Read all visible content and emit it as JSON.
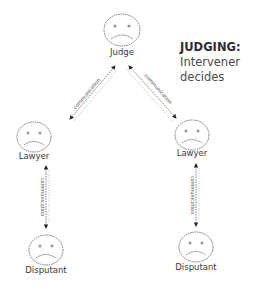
{
  "caption": {
    "title": "JUDGING:",
    "line1": "Intervener",
    "line2": "decides"
  },
  "nodes": {
    "judge": {
      "label": "Judge",
      "expression": "sad"
    },
    "lawyer_left": {
      "label": "Lawyer",
      "expression": "sad"
    },
    "lawyer_right": {
      "label": "Lawyer",
      "expression": "sad"
    },
    "disputant_left": {
      "label": "Disputant",
      "expression": "sad"
    },
    "disputant_right": {
      "label": "Disputant",
      "expression": "sad"
    }
  },
  "edges": [
    {
      "from": "lawyer_left",
      "to": "judge",
      "label": "communication",
      "direction": "bidirectional"
    },
    {
      "from": "judge",
      "to": "lawyer_right",
      "label": "communication",
      "direction": "bidirectional"
    },
    {
      "from": "lawyer_left",
      "to": "disputant_left",
      "label": "communication",
      "direction": "bidirectional"
    },
    {
      "from": "lawyer_right",
      "to": "disputant_right",
      "label": "communication",
      "direction": "bidirectional"
    }
  ],
  "colors": {
    "stroke": "#6a6a6a",
    "arrowhead": "#2a2a2a",
    "text": "#3a3a3a"
  }
}
